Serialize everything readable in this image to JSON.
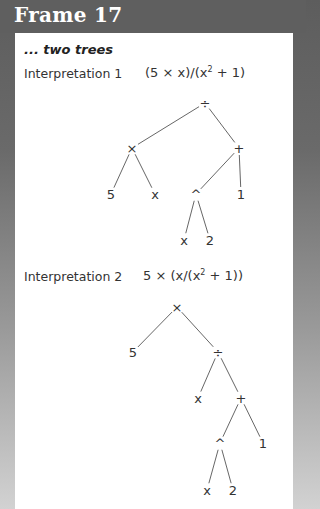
{
  "frame": {
    "title": "Frame 17",
    "subtitle": "... two trees"
  },
  "interpretations": [
    {
      "label": "Interpretation 1",
      "expression_parts": [
        "(5 × x)/(x",
        "2",
        " + 1)"
      ],
      "expression": "(5 × x)/(x² + 1)",
      "tree": {
        "nodes": [
          {
            "id": "n0",
            "label": "÷",
            "x": 205,
            "y": 103
          },
          {
            "id": "n1",
            "label": "×",
            "x": 132,
            "y": 148
          },
          {
            "id": "n2",
            "label": "+",
            "x": 239,
            "y": 148
          },
          {
            "id": "n3",
            "label": "5",
            "x": 111,
            "y": 194
          },
          {
            "id": "n4",
            "label": "x",
            "x": 155,
            "y": 194
          },
          {
            "id": "n5",
            "label": "^",
            "x": 196,
            "y": 194
          },
          {
            "id": "n6",
            "label": "1",
            "x": 241,
            "y": 194
          },
          {
            "id": "n7",
            "label": "x",
            "x": 184,
            "y": 240
          },
          {
            "id": "n8",
            "label": "2",
            "x": 210,
            "y": 240
          }
        ],
        "edges": [
          [
            "n0",
            "n1"
          ],
          [
            "n0",
            "n2"
          ],
          [
            "n1",
            "n3"
          ],
          [
            "n1",
            "n4"
          ],
          [
            "n2",
            "n5"
          ],
          [
            "n2",
            "n6"
          ],
          [
            "n5",
            "n7"
          ],
          [
            "n5",
            "n8"
          ]
        ]
      }
    },
    {
      "label": "Interpretation 2",
      "expression_parts": [
        "5 × (x/(x",
        "2",
        " + 1))"
      ],
      "expression": "5 × (x/(x² + 1))",
      "tree": {
        "nodes": [
          {
            "id": "m0",
            "label": "×",
            "x": 177,
            "y": 307
          },
          {
            "id": "m1",
            "label": "5",
            "x": 133,
            "y": 352
          },
          {
            "id": "m2",
            "label": "÷",
            "x": 218,
            "y": 352
          },
          {
            "id": "m3",
            "label": "x",
            "x": 198,
            "y": 398
          },
          {
            "id": "m4",
            "label": "+",
            "x": 241,
            "y": 398
          },
          {
            "id": "m5",
            "label": "^",
            "x": 220,
            "y": 443
          },
          {
            "id": "m6",
            "label": "1",
            "x": 263,
            "y": 443
          },
          {
            "id": "m7",
            "label": "x",
            "x": 207,
            "y": 490
          },
          {
            "id": "m8",
            "label": "2",
            "x": 233,
            "y": 490
          }
        ],
        "edges": [
          [
            "m0",
            "m1"
          ],
          [
            "m0",
            "m2"
          ],
          [
            "m2",
            "m3"
          ],
          [
            "m2",
            "m4"
          ],
          [
            "m4",
            "m5"
          ],
          [
            "m4",
            "m6"
          ],
          [
            "m5",
            "m7"
          ],
          [
            "m5",
            "m8"
          ]
        ]
      }
    }
  ],
  "colors": {
    "header": "#5f5f5f",
    "panel": "#ffffff",
    "text": "#333333",
    "lines": "#555555"
  }
}
